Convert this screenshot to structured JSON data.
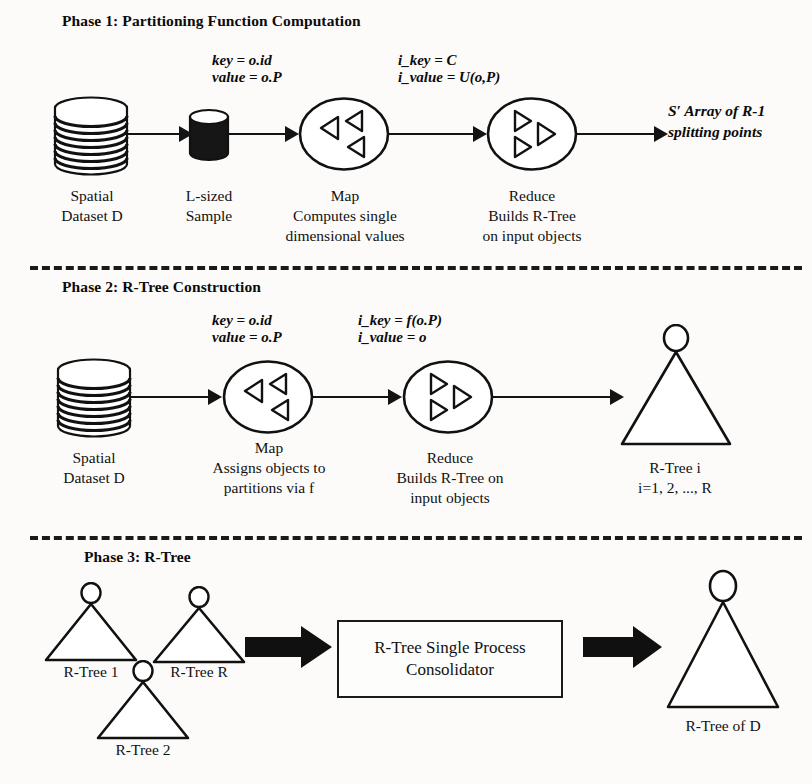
{
  "figure": {
    "background": "#fcfbf9",
    "ink": "#111111"
  },
  "phases": [
    {
      "id": "phase-1",
      "title": "Phase 1: Partitioning Function Computation",
      "edge_labels": [
        {
          "id": "map-input",
          "line1": "key = o.id",
          "line2": "value = o.P"
        },
        {
          "id": "map-output",
          "line1": "i_key =  C",
          "line2": "i_value = U(o,P)"
        }
      ],
      "nodes": [
        {
          "id": "spatial-dataset",
          "type": "cylinder-stack",
          "label_lines": [
            "Spatial",
            "Dataset D"
          ]
        },
        {
          "id": "l-sized-sample",
          "type": "cylinder-small",
          "label_lines": [
            "L-sized",
            "Sample"
          ]
        },
        {
          "id": "map",
          "type": "circle-map",
          "label_lines": [
            "Map",
            "Computes single",
            "dimensional values"
          ]
        },
        {
          "id": "reduce",
          "type": "circle-reduce",
          "label_lines": [
            "Reduce",
            "Builds R-Tree",
            "on input objects"
          ]
        }
      ],
      "output": {
        "id": "splitting-points",
        "line1": "S′ Array of R-1",
        "line2": "splitting points"
      }
    },
    {
      "id": "phase-2",
      "title": "Phase 2: R-Tree Construction",
      "edge_labels": [
        {
          "id": "map-input",
          "line1": "key = o.id",
          "line2": "value = o.P"
        },
        {
          "id": "map-output",
          "line1": "i_key = f(o.P)",
          "line2": "i_value = o"
        }
      ],
      "nodes": [
        {
          "id": "spatial-dataset",
          "type": "cylinder-stack",
          "label_lines": [
            "Spatial",
            "Dataset D"
          ]
        },
        {
          "id": "map",
          "type": "circle-map",
          "label_lines": [
            "Map",
            "Assigns objects to",
            "partitions via f"
          ]
        },
        {
          "id": "reduce",
          "type": "circle-reduce",
          "label_lines": [
            "Reduce",
            "Builds R-Tree on",
            "input objects"
          ]
        },
        {
          "id": "rtree-i",
          "type": "rtree",
          "label_lines": [
            "R-Tree i",
            "i=1, 2, ..., R"
          ]
        }
      ]
    },
    {
      "id": "phase-3",
      "title": "Phase 3: R-Tree",
      "trees": [
        {
          "id": "rtree-1",
          "label": "R-Tree 1"
        },
        {
          "id": "rtree-r",
          "label": "R-Tree R"
        },
        {
          "id": "rtree-2",
          "label": "R-Tree 2"
        }
      ],
      "consolidator": {
        "id": "consolidator-box",
        "line1": "R-Tree Single Process",
        "line2": "Consolidator"
      },
      "output_tree": {
        "id": "rtree-of-d",
        "label": "R-Tree of D"
      }
    }
  ]
}
